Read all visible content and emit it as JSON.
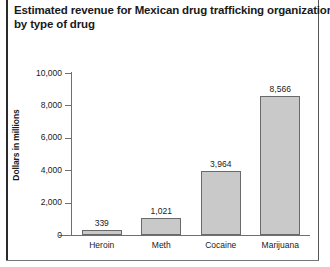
{
  "title": {
    "line1": "Estimated revenue for Mexican drug trafficking organizations,",
    "line2": "by type of drug"
  },
  "chart_data": {
    "type": "bar",
    "title": "Estimated revenue for Mexican drug trafficking organizations, by type of drug",
    "xlabel": "",
    "ylabel": "Dollars in millions",
    "categories": [
      "Heroin",
      "Meth",
      "Cocaine",
      "Marijuana"
    ],
    "values": [
      339,
      1021,
      3964,
      8566
    ],
    "value_labels": [
      "339",
      "1,021",
      "3,964",
      "8,566"
    ],
    "ylim": [
      0,
      10000
    ],
    "yticks": [
      0,
      2000,
      4000,
      6000,
      8000,
      10000
    ],
    "ytick_labels": [
      "0",
      "2,000",
      "4,000",
      "6,000",
      "8,000",
      "10,000"
    ],
    "grid": false,
    "legend": false,
    "bar_color": "#c9c9c9",
    "bar_edge_color": "#6a6a6a",
    "axis_color": "#6f6f6f",
    "text_color": "#1a1a1a"
  }
}
